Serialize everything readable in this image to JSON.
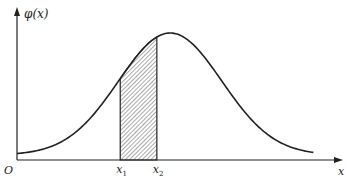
{
  "chart_data": {
    "type": "line",
    "title": "",
    "ylabel": "φ(x)",
    "xlabel": "x",
    "origin_label": "O",
    "curve": {
      "function": "normal_pdf",
      "mean_rel": 0.46,
      "sd_rel": 0.155,
      "domain_rel": [
        0,
        0.89
      ]
    },
    "shaded_region": {
      "from_label": "x",
      "from_sub": "1",
      "to_label": "x",
      "to_sub": "2",
      "from_rel": 0.31,
      "to_rel": 0.42,
      "fill_pattern": "diagonal-hatch"
    },
    "colors": {
      "stroke": "#222222",
      "hatch": "#555555"
    }
  }
}
